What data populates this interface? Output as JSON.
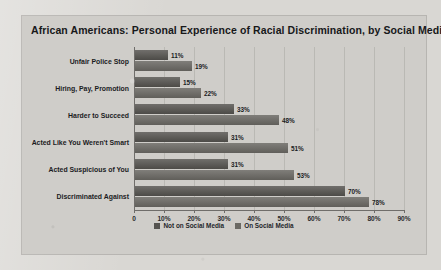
{
  "chart_data": {
    "type": "bar",
    "orientation": "horizontal",
    "title": "African Americans: Personal Experience of Racial Discrimination, by Social Media Use",
    "xlabel": "",
    "ylabel": "",
    "xlim": [
      0,
      90
    ],
    "xticks": [
      "0",
      "10%",
      "20%",
      "30%",
      "40%",
      "50%",
      "60%",
      "70%",
      "80%",
      "90%"
    ],
    "xtick_values": [
      0,
      10,
      20,
      30,
      40,
      50,
      60,
      70,
      80,
      90
    ],
    "grid": true,
    "legend_position": "bottom-center",
    "categories": [
      "Unfair Police Stop",
      "Hiring, Pay, Promotion",
      "Harder to Succeed",
      "Acted Like You Weren't Smart",
      "Acted Suspicious of You",
      "Discriminated Against"
    ],
    "series": [
      {
        "name": "Not on Social Media",
        "color": "#55534f",
        "values": [
          11,
          15,
          33,
          31,
          31,
          70
        ],
        "labels": [
          "11%",
          "15%",
          "33%",
          "31%",
          "31%",
          "70%"
        ]
      },
      {
        "name": "On Social Media",
        "color": "#6b6964",
        "values": [
          19,
          22,
          48,
          51,
          53,
          78
        ],
        "labels": [
          "19%",
          "22%",
          "48%",
          "51%",
          "53%",
          "78%"
        ]
      }
    ]
  }
}
